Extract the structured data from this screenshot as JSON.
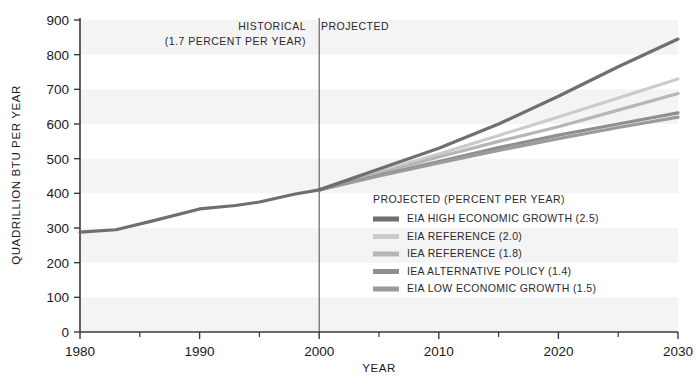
{
  "chart_data": {
    "type": "line",
    "title": "",
    "xlabel": "YEAR",
    "ylabel": "QUADRILLION BTU PER YEAR",
    "xlim": [
      1980,
      2030
    ],
    "ylim": [
      0,
      900
    ],
    "yticks": [
      0,
      100,
      200,
      300,
      400,
      500,
      600,
      700,
      800,
      900
    ],
    "xticks": [
      1980,
      1990,
      2000,
      2010,
      2020,
      2030
    ],
    "xminorticks": [
      1985,
      1995,
      2005,
      2015,
      2025
    ],
    "grid": false,
    "background_bands": true,
    "legend_position": "inside-center-right",
    "divider_year": 2000,
    "annotations": [
      {
        "name": "historical-label",
        "text": "HISTORICAL",
        "year": 2000,
        "align": "right"
      },
      {
        "name": "historical-rate",
        "text": "(1.7 PERCENT PER YEAR)",
        "year": 2000,
        "align": "right"
      },
      {
        "name": "projected-label",
        "text": "PROJECTED",
        "year": 2000,
        "align": "left"
      }
    ],
    "legend_title": "PROJECTED (PERCENT PER YEAR)",
    "historical": {
      "name": "HISTORICAL",
      "color": "#6f6f6f",
      "x": [
        1980,
        1983,
        1986,
        1990,
        1993,
        1995,
        1998,
        2000
      ],
      "values": [
        288,
        295,
        320,
        355,
        365,
        375,
        398,
        410
      ]
    },
    "series": [
      {
        "name": "EIA HIGH ECONOMIC GROWTH (2.5)",
        "label": "EIA HIGH ECONOMIC GROWTH (2.5)",
        "color": "#6f6f6f",
        "x": [
          2000,
          2005,
          2010,
          2015,
          2020,
          2025,
          2030
        ],
        "values": [
          410,
          470,
          530,
          600,
          680,
          765,
          845
        ]
      },
      {
        "name": "EIA REFERENCE (2.0)",
        "label": "EIA REFERENCE (2.0)",
        "color": "#cbcbcb",
        "x": [
          2000,
          2005,
          2010,
          2015,
          2020,
          2025,
          2030
        ],
        "values": [
          410,
          463,
          513,
          567,
          620,
          675,
          730
        ]
      },
      {
        "name": "IEA REFERENCE (1.8)",
        "label": "IEA REFERENCE (1.8)",
        "color": "#b6b6b6",
        "x": [
          2000,
          2005,
          2010,
          2015,
          2020,
          2025,
          2030
        ],
        "values": [
          410,
          458,
          505,
          550,
          592,
          640,
          688
        ]
      },
      {
        "name": "IEA ALTERNATIVE POLICY (1.4)",
        "label": "IEA ALTERNATIVE POLICY (1.4)",
        "color": "#8f8f8f",
        "x": [
          2000,
          2005,
          2010,
          2015,
          2020,
          2025,
          2030
        ],
        "values": [
          410,
          452,
          492,
          532,
          568,
          600,
          632
        ]
      },
      {
        "name": "EIA LOW ECONOMIC GROWTH (1.5)",
        "label": "EIA LOW ECONOMIC GROWTH (1.5)",
        "color": "#9b9b9b",
        "x": [
          2000,
          2005,
          2010,
          2015,
          2020,
          2025,
          2030
        ],
        "values": [
          410,
          450,
          488,
          524,
          558,
          590,
          620
        ]
      }
    ]
  },
  "axes": {
    "y_title": "QUADRILLION BTU PER YEAR",
    "x_title": "YEAR",
    "y_tick_labels": [
      "0",
      "100",
      "200",
      "300",
      "400",
      "500",
      "600",
      "700",
      "800",
      "900"
    ],
    "x_tick_labels": [
      "1980",
      "1990",
      "2000",
      "2010",
      "2020",
      "2030"
    ]
  },
  "annotations": {
    "historical": "HISTORICAL",
    "historical_rate": "(1.7 PERCENT PER YEAR)",
    "projected": "PROJECTED"
  },
  "legend": {
    "title": "PROJECTED (PERCENT PER YEAR)",
    "items": [
      {
        "label": "EIA HIGH ECONOMIC GROWTH (2.5)",
        "color": "#6f6f6f"
      },
      {
        "label": "EIA REFERENCE (2.0)",
        "color": "#cbcbcb"
      },
      {
        "label": "IEA REFERENCE (1.8)",
        "color": "#b6b6b6"
      },
      {
        "label": "IEA ALTERNATIVE POLICY (1.4)",
        "color": "#8f8f8f"
      },
      {
        "label": "EIA LOW ECONOMIC GROWTH (1.5)",
        "color": "#9b9b9b"
      }
    ]
  },
  "style": {
    "axis_color": "#3a3a3a",
    "band_color": "#f4f4f4",
    "divider_color": "#5a5a5a",
    "text_color": "#1a1a1a"
  }
}
